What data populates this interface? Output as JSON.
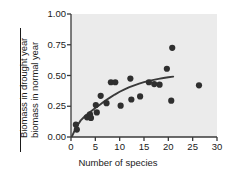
{
  "chart_data": {
    "type": "scatter",
    "title": "",
    "xlabel": "Number of species",
    "ylabel": "Biomass in drought year / biomass in normal year",
    "ylabel_numerator": "Biomass in drought year",
    "ylabel_denominator": "biomass in normal year",
    "xlim": [
      0,
      30
    ],
    "ylim": [
      0.0,
      1.0
    ],
    "xticks": [
      0,
      5,
      10,
      15,
      20,
      25,
      30
    ],
    "xtick_labels": [
      "0",
      "5",
      "10",
      "15",
      "20",
      "25",
      "30"
    ],
    "yticks": [
      0.0,
      0.25,
      0.5,
      0.75,
      1.0
    ],
    "ytick_labels": [
      "0.00",
      "0.25",
      "0.50",
      "0.75",
      "1.00"
    ],
    "grid": false,
    "legend": null,
    "marker_color": "#2f2f2f",
    "marker_size": 3.1,
    "line_color": "#3a3a3a",
    "line_width": 1.9,
    "axis_color": "#3a3a3a",
    "plot_background": "#ebebeb",
    "points": [
      {
        "x": 1.0,
        "y": 0.1
      },
      {
        "x": 1.2,
        "y": 0.06
      },
      {
        "x": 3.3,
        "y": 0.16
      },
      {
        "x": 3.9,
        "y": 0.185
      },
      {
        "x": 4.1,
        "y": 0.155
      },
      {
        "x": 5.1,
        "y": 0.26
      },
      {
        "x": 5.3,
        "y": 0.2
      },
      {
        "x": 6.1,
        "y": 0.335
      },
      {
        "x": 7.3,
        "y": 0.275
      },
      {
        "x": 8.2,
        "y": 0.445
      },
      {
        "x": 9.1,
        "y": 0.445
      },
      {
        "x": 10.2,
        "y": 0.255
      },
      {
        "x": 12.2,
        "y": 0.475
      },
      {
        "x": 12.4,
        "y": 0.305
      },
      {
        "x": 14.2,
        "y": 0.33
      },
      {
        "x": 16.0,
        "y": 0.445
      },
      {
        "x": 17.1,
        "y": 0.43
      },
      {
        "x": 18.2,
        "y": 0.425
      },
      {
        "x": 19.7,
        "y": 0.555
      },
      {
        "x": 20.6,
        "y": 0.295
      },
      {
        "x": 20.8,
        "y": 0.725
      },
      {
        "x": 26.3,
        "y": 0.42
      }
    ],
    "fit_curve": {
      "description": "rising saturating curve through the cloud",
      "points": [
        {
          "x": 0.2,
          "y": 0.005
        },
        {
          "x": 1.0,
          "y": 0.075
        },
        {
          "x": 2.0,
          "y": 0.135
        },
        {
          "x": 3.0,
          "y": 0.175
        },
        {
          "x": 4.0,
          "y": 0.205
        },
        {
          "x": 5.0,
          "y": 0.235
        },
        {
          "x": 6.0,
          "y": 0.265
        },
        {
          "x": 7.0,
          "y": 0.295
        },
        {
          "x": 8.0,
          "y": 0.32
        },
        {
          "x": 9.0,
          "y": 0.345
        },
        {
          "x": 10.0,
          "y": 0.368
        },
        {
          "x": 11.0,
          "y": 0.388
        },
        {
          "x": 12.0,
          "y": 0.405
        },
        {
          "x": 13.0,
          "y": 0.42
        },
        {
          "x": 14.0,
          "y": 0.434
        },
        {
          "x": 15.0,
          "y": 0.446
        },
        {
          "x": 16.0,
          "y": 0.456
        },
        {
          "x": 17.0,
          "y": 0.465
        },
        {
          "x": 18.0,
          "y": 0.473
        },
        {
          "x": 19.0,
          "y": 0.48
        },
        {
          "x": 20.0,
          "y": 0.486
        },
        {
          "x": 21.0,
          "y": 0.491
        }
      ]
    }
  }
}
